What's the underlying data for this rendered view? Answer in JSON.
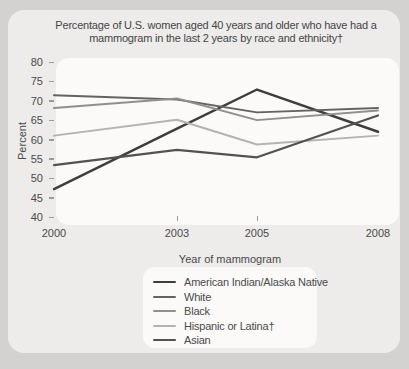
{
  "figure": {
    "title": "Percentage of U.S. women aged 40 years and older who have had a mammogram in the last 2 years by race and ethnicity†",
    "xlabel": "Year of mammogram",
    "ylabel": "Percent"
  },
  "chart_data": {
    "type": "line",
    "title": "Percentage of U.S. women aged 40 years and older who have had a mammogram in the last 2 years by race and ethnicity†",
    "xlabel": "Year of mammogram",
    "ylabel": "Percent",
    "ylim": [
      40,
      80
    ],
    "yticks": [
      80,
      75,
      70,
      65,
      60,
      55,
      50,
      45,
      40
    ],
    "categories": [
      "2000",
      "2003",
      "2005",
      "2008"
    ],
    "grid": false,
    "legend_position": "bottom",
    "series": [
      {
        "name": "American Indian/Alaska Native",
        "color": "#3d3d3d",
        "stroke_width": 2.4,
        "values": [
          47.2,
          62.8,
          72.9,
          62.0
        ]
      },
      {
        "name": "White",
        "color": "#636363",
        "stroke_width": 2.0,
        "values": [
          71.4,
          70.3,
          67.0,
          68.1
        ]
      },
      {
        "name": "Black",
        "color": "#8f8f8f",
        "stroke_width": 2.0,
        "values": [
          68.1,
          70.6,
          65.0,
          67.5
        ]
      },
      {
        "name": "Hispanic or Latina†",
        "color": "#b3b3b3",
        "stroke_width": 2.0,
        "values": [
          61.0,
          65.1,
          58.7,
          61.0
        ]
      },
      {
        "name": "Asian",
        "color": "#525252",
        "stroke_width": 2.2,
        "values": [
          53.4,
          57.3,
          55.4,
          66.2
        ]
      }
    ]
  }
}
